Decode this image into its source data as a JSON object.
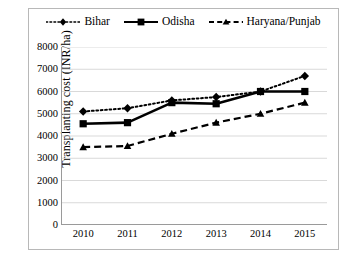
{
  "chart_data": {
    "type": "line",
    "title": "",
    "subtitle": "",
    "xlabel": "",
    "ylabel": "Transplanting cost (INR/ha)",
    "categories": [
      "2010",
      "2011",
      "2012",
      "2013",
      "2014",
      "2015"
    ],
    "x": [
      2010,
      2011,
      2012,
      2013,
      2014,
      2015
    ],
    "ylim": [
      0,
      8000
    ],
    "yticks": [
      0,
      1000,
      2000,
      3000,
      4000,
      5000,
      6000,
      7000,
      8000
    ],
    "ytick_labels": [
      "0",
      "1000",
      "2000",
      "3000",
      "4000",
      "5000",
      "6000",
      "7000",
      "8000"
    ],
    "grid": "horizontal",
    "legend_position": "top-center",
    "series": [
      {
        "name": "Bihar",
        "values": [
          5100,
          5250,
          5600,
          5750,
          6000,
          6700
        ],
        "style": "dotted",
        "marker": "diamond",
        "color": "#000000"
      },
      {
        "name": "Odisha",
        "values": [
          4550,
          4600,
          5500,
          5450,
          6000,
          6000
        ],
        "style": "solid",
        "marker": "square",
        "color": "#000000"
      },
      {
        "name": "Haryana/Punjab",
        "values": [
          3500,
          3550,
          4100,
          4600,
          5000,
          5500
        ],
        "style": "dashed",
        "marker": "triangle",
        "color": "#000000"
      }
    ]
  },
  "legend": {
    "items": [
      {
        "label": "Bihar",
        "icon": "dotted-line-diamond-marker-icon"
      },
      {
        "label": "Odisha",
        "icon": "solid-line-square-marker-icon"
      },
      {
        "label": "Haryana/Punjab",
        "icon": "dashed-line-triangle-marker-icon"
      }
    ]
  },
  "colors": {
    "series": "#000000",
    "gridline": "#d9d9d9",
    "axis": "#9a9a9a",
    "frame": "#b8b8b8",
    "background": "#ffffff"
  }
}
